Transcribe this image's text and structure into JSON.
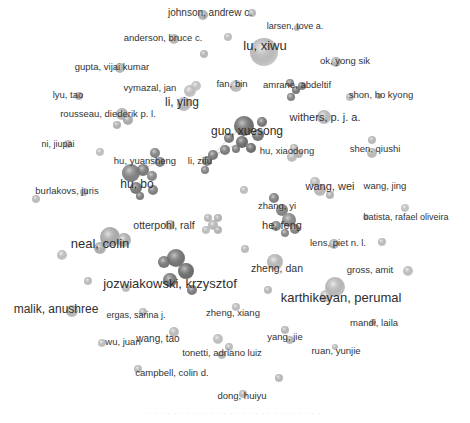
{
  "network": {
    "type": "co-authorship network",
    "labels": [
      {
        "text": "johnson, andrew c.",
        "x": 210,
        "y": 13,
        "size": 10
      },
      {
        "text": "larsen, tove a.",
        "x": 295,
        "y": 26,
        "size": 9
      },
      {
        "text": "anderson, bruce c.",
        "x": 163,
        "y": 38,
        "size": 9.5
      },
      {
        "text": "lu, xiwu",
        "x": 265,
        "y": 45,
        "size": 13
      },
      {
        "text": "ok, yong sik",
        "x": 345,
        "y": 61,
        "size": 9.5
      },
      {
        "text": "gupta, vijai kumar",
        "x": 112,
        "y": 67,
        "size": 9.5
      },
      {
        "text": "fan, bin",
        "x": 232,
        "y": 84,
        "size": 9.5
      },
      {
        "text": "amrane, abdeltif",
        "x": 297,
        "y": 85,
        "size": 9.5
      },
      {
        "text": "lyu, tao",
        "x": 68,
        "y": 95,
        "size": 9.5
      },
      {
        "text": "vymazal, jan",
        "x": 150,
        "y": 88,
        "size": 9.5
      },
      {
        "text": "shon, ho kyong",
        "x": 381,
        "y": 95,
        "size": 9.5
      },
      {
        "text": "li, ying",
        "x": 182,
        "y": 102,
        "size": 12
      },
      {
        "text": "rousseau, diederik p. l.",
        "x": 108,
        "y": 114,
        "size": 9.5
      },
      {
        "text": "withers, p. j. a.",
        "x": 325,
        "y": 117,
        "size": 11
      },
      {
        "text": "guo, xuesong",
        "x": 247,
        "y": 131,
        "size": 12
      },
      {
        "text": "ni, jiupai",
        "x": 58,
        "y": 144,
        "size": 9
      },
      {
        "text": "hu, xiaodong",
        "x": 287,
        "y": 151,
        "size": 9.5
      },
      {
        "text": "shen, qiushi",
        "x": 375,
        "y": 149,
        "size": 9.5
      },
      {
        "text": "hu, yuansheng",
        "x": 145,
        "y": 161,
        "size": 9.5
      },
      {
        "text": "li, zifu",
        "x": 200,
        "y": 161,
        "size": 9.5
      },
      {
        "text": "hu, bo",
        "x": 137,
        "y": 184,
        "size": 12
      },
      {
        "text": "wang, wei",
        "x": 330,
        "y": 186,
        "size": 11
      },
      {
        "text": "wang, jing",
        "x": 385,
        "y": 186,
        "size": 9.5
      },
      {
        "text": "burlakovs, juris",
        "x": 67,
        "y": 191,
        "size": 9.5
      },
      {
        "text": "zhang, yi",
        "x": 277,
        "y": 206,
        "size": 9.5
      },
      {
        "text": "otterpohl, ralf",
        "x": 164,
        "y": 225,
        "size": 10.5
      },
      {
        "text": "he, feng",
        "x": 282,
        "y": 225,
        "size": 11
      },
      {
        "text": "batista, rafael oliveira",
        "x": 406,
        "y": 217,
        "size": 9
      },
      {
        "text": "neal, colin",
        "x": 100,
        "y": 243,
        "size": 13
      },
      {
        "text": "lens, piet n. l.",
        "x": 338,
        "y": 243,
        "size": 9.5
      },
      {
        "text": "zheng, dan",
        "x": 277,
        "y": 268,
        "size": 10.5
      },
      {
        "text": "gross, amit",
        "x": 370,
        "y": 270,
        "size": 9.5
      },
      {
        "text": "jozwiakowski, krzysztof",
        "x": 170,
        "y": 283,
        "size": 13
      },
      {
        "text": "karthikeyan, perumal",
        "x": 341,
        "y": 297,
        "size": 13
      },
      {
        "text": "malik, anushree",
        "x": 56,
        "y": 309,
        "size": 12
      },
      {
        "text": "ergas, sarina j.",
        "x": 136,
        "y": 315,
        "size": 9
      },
      {
        "text": "zheng, xiang",
        "x": 233,
        "y": 313,
        "size": 9.5
      },
      {
        "text": "mandi, laila",
        "x": 374,
        "y": 323,
        "size": 9.5
      },
      {
        "text": "wang, tao",
        "x": 158,
        "y": 339,
        "size": 10
      },
      {
        "text": "wu, juan",
        "x": 123,
        "y": 342,
        "size": 9.5
      },
      {
        "text": "yang, jie",
        "x": 285,
        "y": 337,
        "size": 9.5
      },
      {
        "text": "tonetti, adriano luiz",
        "x": 222,
        "y": 353,
        "size": 9.5
      },
      {
        "text": "ruan, yunjie",
        "x": 336,
        "y": 351,
        "size": 9.5
      },
      {
        "text": "campbell, colin d.",
        "x": 172,
        "y": 373,
        "size": 9.5
      },
      {
        "text": "dong, huiyu",
        "x": 242,
        "y": 396,
        "size": 9.5
      }
    ],
    "nodes": [
      {
        "x": 203,
        "y": 15,
        "r": 5,
        "c": "#c8c8c8"
      },
      {
        "x": 252,
        "y": 13,
        "r": 4,
        "c": "#d0d0d0"
      },
      {
        "x": 297,
        "y": 28,
        "r": 3,
        "c": "#c4c4c4"
      },
      {
        "x": 174,
        "y": 39,
        "r": 5,
        "c": "#cfcfcf"
      },
      {
        "x": 228,
        "y": 37,
        "r": 4,
        "c": "#d8d8d8"
      },
      {
        "x": 204,
        "y": 54,
        "r": 4,
        "c": "#cfcfcf"
      },
      {
        "x": 264,
        "y": 52,
        "r": 14,
        "c": "#d6d6d6"
      },
      {
        "x": 336,
        "y": 62,
        "r": 5,
        "c": "#c6c6c6"
      },
      {
        "x": 120,
        "y": 68,
        "r": 5,
        "c": "#cccccc"
      },
      {
        "x": 236,
        "y": 86,
        "r": 6,
        "c": "#d6d6d6"
      },
      {
        "x": 290,
        "y": 83,
        "r": 4,
        "c": "#8e8e8e"
      },
      {
        "x": 296,
        "y": 90,
        "r": 4,
        "c": "#7a7a7a"
      },
      {
        "x": 291,
        "y": 97,
        "r": 4,
        "c": "#8a8a8a"
      },
      {
        "x": 302,
        "y": 86,
        "r": 4,
        "c": "#888"
      },
      {
        "x": 79,
        "y": 96,
        "r": 4,
        "c": "#c2c2c2"
      },
      {
        "x": 190,
        "y": 91,
        "r": 6,
        "c": "#dcdcdc"
      },
      {
        "x": 196,
        "y": 86,
        "r": 5,
        "c": "#e0e0e0"
      },
      {
        "x": 184,
        "y": 104,
        "r": 7,
        "c": "#cfcfcf"
      },
      {
        "x": 350,
        "y": 97,
        "r": 4,
        "c": "#d8d8d8"
      },
      {
        "x": 379,
        "y": 96,
        "r": 3,
        "c": "#c0c0c0"
      },
      {
        "x": 122,
        "y": 114,
        "r": 6,
        "c": "#c8c8c8"
      },
      {
        "x": 128,
        "y": 120,
        "r": 5,
        "c": "#bdbdbd"
      },
      {
        "x": 117,
        "y": 125,
        "r": 4,
        "c": "#c6c6c6"
      },
      {
        "x": 324,
        "y": 117,
        "r": 7,
        "c": "#d4d4d4"
      },
      {
        "x": 244,
        "y": 126,
        "r": 10,
        "c": "#6e6e6e"
      },
      {
        "x": 258,
        "y": 135,
        "r": 6,
        "c": "#7a7a7a"
      },
      {
        "x": 229,
        "y": 138,
        "r": 5,
        "c": "#7c7c7c"
      },
      {
        "x": 242,
        "y": 142,
        "r": 6,
        "c": "#6a6a6a"
      },
      {
        "x": 225,
        "y": 150,
        "r": 5,
        "c": "#7e7e7e"
      },
      {
        "x": 236,
        "y": 149,
        "r": 4,
        "c": "#808080"
      },
      {
        "x": 251,
        "y": 148,
        "r": 5,
        "c": "#6c6c6c"
      },
      {
        "x": 262,
        "y": 122,
        "r": 5,
        "c": "#787878"
      },
      {
        "x": 213,
        "y": 155,
        "r": 5,
        "c": "#7c7c7c"
      },
      {
        "x": 207,
        "y": 161,
        "r": 5,
        "c": "#858585"
      },
      {
        "x": 205,
        "y": 170,
        "r": 4,
        "c": "#8a8a8a"
      },
      {
        "x": 294,
        "y": 148,
        "r": 4,
        "c": "#d0d0d0"
      },
      {
        "x": 292,
        "y": 157,
        "r": 5,
        "c": "#d6d6d6"
      },
      {
        "x": 299,
        "y": 154,
        "r": 4,
        "c": "#cccccc"
      },
      {
        "x": 372,
        "y": 140,
        "r": 4,
        "c": "#d2d2d2"
      },
      {
        "x:": 0,
        "x": 372,
        "y": 153,
        "r": 5,
        "c": "#d4d4d4"
      },
      {
        "x": 68,
        "y": 144,
        "r": 4,
        "c": "#d0d0d0"
      },
      {
        "x": 100,
        "y": 152,
        "r": 4,
        "c": "#dcdcdc"
      },
      {
        "x": 155,
        "y": 153,
        "r": 5,
        "c": "#8a8a8a"
      },
      {
        "x": 160,
        "y": 162,
        "r": 5,
        "c": "#888"
      },
      {
        "x": 143,
        "y": 170,
        "r": 6,
        "c": "#7c7c7c"
      },
      {
        "x": 131,
        "y": 173,
        "r": 9,
        "c": "#858585"
      },
      {
        "x": 152,
        "y": 176,
        "r": 5,
        "c": "#8c8c8c"
      },
      {
        "x": 136,
        "y": 188,
        "r": 6,
        "c": "#7a7a7a"
      },
      {
        "x": 153,
        "y": 190,
        "r": 5,
        "c": "#848484"
      },
      {
        "x": 140,
        "y": 196,
        "r": 4,
        "c": "#808080"
      },
      {
        "x": 315,
        "y": 182,
        "r": 5,
        "c": "#d8d8d8"
      },
      {
        "x": 320,
        "y": 190,
        "r": 6,
        "c": "#d0d0d0"
      },
      {
        "x": 330,
        "y": 195,
        "r": 4,
        "c": "#cacaca"
      },
      {
        "x": 244,
        "y": 190,
        "r": 4,
        "c": "#d8d8d8"
      },
      {
        "x": 36,
        "y": 199,
        "r": 4,
        "c": "#d4d4d4"
      },
      {
        "x": 84,
        "y": 192,
        "r": 4,
        "c": "#d0d0d0"
      },
      {
        "x": 274,
        "y": 198,
        "r": 5,
        "c": "#858585"
      },
      {
        "x": 282,
        "y": 210,
        "r": 6,
        "c": "#8a8a8a"
      },
      {
        "x": 289,
        "y": 220,
        "r": 7,
        "c": "#909090"
      },
      {
        "x": 276,
        "y": 226,
        "r": 5,
        "c": "#8c8c8c"
      },
      {
        "x": 295,
        "y": 229,
        "r": 5,
        "c": "#888"
      },
      {
        "x": 285,
        "y": 233,
        "r": 4,
        "c": "#8e8e8e"
      },
      {
        "x": 208,
        "y": 218,
        "r": 4,
        "c": "#d0d0d0"
      },
      {
        "x": 218,
        "y": 218,
        "r": 4,
        "c": "#cacaca"
      },
      {
        "x": 213,
        "y": 225,
        "r": 5,
        "c": "#d4d4d4"
      },
      {
        "x": 206,
        "y": 230,
        "r": 4,
        "c": "#d8d8d8"
      },
      {
        "x": 218,
        "y": 230,
        "r": 4,
        "c": "#cccccc"
      },
      {
        "x": 170,
        "y": 225,
        "r": 5,
        "c": "#d6d6d6"
      },
      {
        "x": 405,
        "y": 208,
        "r": 4,
        "c": "#e0e0e0"
      },
      {
        "x": 366,
        "y": 217,
        "r": 3,
        "c": "#d6d6d6"
      },
      {
        "x": 110,
        "y": 237,
        "r": 10,
        "c": "#bdbdbd"
      },
      {
        "x": 124,
        "y": 240,
        "r": 7,
        "c": "#c4c4c4"
      },
      {
        "x": 100,
        "y": 248,
        "r": 6,
        "c": "#c2c2c2"
      },
      {
        "x": 62,
        "y": 255,
        "r": 5,
        "c": "#dcdcdc"
      },
      {
        "x": 334,
        "y": 244,
        "r": 5,
        "c": "#cccccc"
      },
      {
        "x": 382,
        "y": 242,
        "r": 4,
        "c": "#d6d6d6"
      },
      {
        "x": 245,
        "y": 249,
        "r": 4,
        "c": "#d4d4d4"
      },
      {
        "x": 176,
        "y": 258,
        "r": 9,
        "c": "#737373"
      },
      {
        "x": 164,
        "y": 262,
        "r": 6,
        "c": "#7a7a7a"
      },
      {
        "x": 186,
        "y": 271,
        "r": 8,
        "c": "#6c6c6c"
      },
      {
        "x": 170,
        "y": 280,
        "r": 7,
        "c": "#787878"
      },
      {
        "x": 192,
        "y": 290,
        "r": 5,
        "c": "#7e7e7e"
      },
      {
        "x": 88,
        "y": 281,
        "r": 4,
        "c": "#d6d6d6"
      },
      {
        "x": 126,
        "y": 288,
        "r": 4,
        "c": "#d6d6d6"
      },
      {
        "x": 275,
        "y": 262,
        "r": 8,
        "c": "#cfcfcf"
      },
      {
        "x": 268,
        "y": 290,
        "r": 4,
        "c": "#d2d2d2"
      },
      {
        "x": 335,
        "y": 287,
        "r": 10,
        "c": "#d2d2d2"
      },
      {
        "x": 326,
        "y": 296,
        "r": 6,
        "c": "#d8d8d8"
      },
      {
        "x": 408,
        "y": 271,
        "r": 5,
        "c": "#dcdcdc"
      },
      {
        "x": 72,
        "y": 311,
        "r": 6,
        "c": "#cfcfcf"
      },
      {
        "x": 143,
        "y": 312,
        "r": 4,
        "c": "#d4d4d4"
      },
      {
        "x": 236,
        "y": 307,
        "r": 4,
        "c": "#d8d8d8"
      },
      {
        "x": 373,
        "y": 322,
        "r": 3,
        "c": "#c8c8c8"
      },
      {
        "x": 174,
        "y": 332,
        "r": 5,
        "c": "#d6d6d6"
      },
      {
        "x": 102,
        "y": 343,
        "r": 4,
        "c": "#dcdcdc"
      },
      {
        "x": 285,
        "y": 330,
        "r": 4,
        "c": "#d0d0d0"
      },
      {
        "x": 290,
        "y": 340,
        "r": 4,
        "c": "#cfcfcf"
      },
      {
        "x": 218,
        "y": 339,
        "r": 5,
        "c": "#dadada"
      },
      {
        "x": 229,
        "y": 347,
        "r": 4,
        "c": "#d6d6d6"
      },
      {
        "x": 222,
        "y": 355,
        "r": 4,
        "c": "#d2d2d2"
      },
      {
        "x": 335,
        "y": 347,
        "r": 3,
        "c": "#d6d6d6"
      },
      {
        "x": 279,
        "y": 378,
        "r": 4,
        "c": "#d0d0d0"
      },
      {
        "x": 138,
        "y": 369,
        "r": 4,
        "c": "#d6d6d6"
      },
      {
        "x": 243,
        "y": 394,
        "r": 4,
        "c": "#d0d0d0"
      }
    ],
    "edges": [
      [
        229,
        138,
        244,
        126
      ],
      [
        213,
        155,
        229,
        138
      ],
      [
        213,
        155,
        242,
        142
      ],
      [
        207,
        161,
        225,
        150
      ],
      [
        143,
        170,
        155,
        153
      ],
      [
        131,
        173,
        160,
        162
      ],
      [
        176,
        258,
        186,
        271
      ],
      [
        110,
        237,
        124,
        240
      ]
    ]
  },
  "caption": "· · · · · · · · · · · · · · · · · · · · · · · · · · · ·"
}
